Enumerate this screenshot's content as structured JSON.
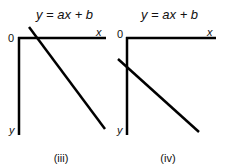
{
  "panels": [
    {
      "id": "iii",
      "equation": "y = ax + b",
      "origin_label": "0",
      "x_axis_label": "x",
      "y_axis_label": "y",
      "caption": "(iii)",
      "description": "Line crosses x-axis just right of origin, sloping down-right (y-axis points down)"
    },
    {
      "id": "iv",
      "equation": "y = ax + b",
      "origin_label": "0",
      "x_axis_label": "x",
      "y_axis_label": "y",
      "caption": "(iv)",
      "description": "Line crosses y-axis below origin, sloping down-right (y-axis points down)"
    }
  ],
  "colors": {
    "line": "#000000",
    "background": "#ffffff"
  }
}
